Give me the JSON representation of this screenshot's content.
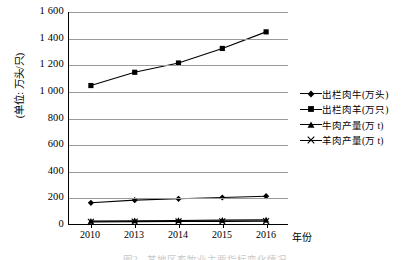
{
  "axes": {
    "y_title": "(单位: 万头/只)",
    "y_ticks": [
      "1 600",
      "1 400",
      "1 200",
      "1 000",
      "800",
      "600",
      "400",
      "200",
      "0"
    ],
    "x_title": "年份",
    "x_ticks": [
      "2010",
      "2013",
      "2014",
      "2015",
      "2016"
    ]
  },
  "legend": {
    "items": [
      {
        "label": "出栏肉牛(万头)",
        "marker": "diamond-marker"
      },
      {
        "label": "出栏肉羊(万只)",
        "marker": "square-marker"
      },
      {
        "label": "牛肉产量(万 t)",
        "marker": "triangle-marker"
      },
      {
        "label": "羊肉产量(万 t)",
        "marker": "cross-marker"
      }
    ]
  },
  "caption": {
    "text": "图2　某地区畜牧业主要指标变化情况"
  },
  "chart_data": {
    "type": "line",
    "title": "",
    "xlabel": "年份",
    "ylabel": "(单位: 万头/只)",
    "categories": [
      "2010",
      "2013",
      "2014",
      "2015",
      "2016"
    ],
    "ylim": [
      0,
      1600
    ],
    "ytick_step": 200,
    "grid": true,
    "legend_position": "right",
    "series": [
      {
        "name": "出栏肉牛(万头)",
        "marker": "diamond",
        "values": [
          160,
          180,
          190,
          200,
          210
        ]
      },
      {
        "name": "出栏肉羊(万只)",
        "marker": "square",
        "values": [
          1045,
          1145,
          1215,
          1325,
          1450
        ]
      },
      {
        "name": "牛肉产量(万 t)",
        "marker": "triangle",
        "values": [
          22,
          25,
          27,
          29,
          31
        ]
      },
      {
        "name": "羊肉产量(万 t)",
        "marker": "cross",
        "values": [
          16,
          18,
          19,
          20,
          22
        ]
      }
    ]
  }
}
